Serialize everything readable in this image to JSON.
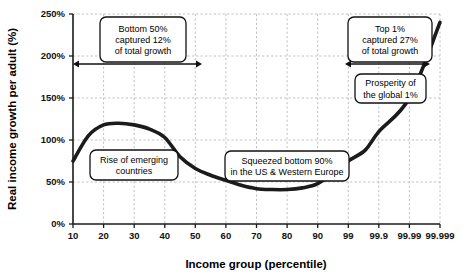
{
  "chart_data": {
    "type": "line",
    "title": "",
    "subtitle": "",
    "xlabel": "Income group (percentile)",
    "ylabel": "Real income growth per adult (%)",
    "grid": true,
    "legend": "none",
    "x_tick_labels": [
      "10",
      "20",
      "30",
      "40",
      "50",
      "60",
      "70",
      "80",
      "90",
      "99",
      "99.9",
      "99.99",
      "99.999"
    ],
    "y_tick_labels": [
      "0%",
      "50%",
      "100%",
      "150%",
      "200%",
      "250%"
    ],
    "y_tick_values": [
      0,
      50,
      100,
      150,
      200,
      250
    ],
    "ylim": [
      0,
      250
    ],
    "series": [
      {
        "name": "Real income growth per adult",
        "x": [
          "10",
          "15",
          "20",
          "25",
          "30",
          "35",
          "40",
          "45",
          "50",
          "55",
          "60",
          "65",
          "70",
          "75",
          "80",
          "85",
          "90",
          "95",
          "99",
          "99.5",
          "99.9",
          "99.99",
          "99.999"
        ],
        "values": [
          75,
          105,
          118,
          120,
          118,
          113,
          103,
          80,
          66,
          58,
          52,
          46,
          42,
          41,
          41,
          43,
          48,
          62,
          75,
          88,
          110,
          150,
          240
        ]
      }
    ],
    "annotations": [
      {
        "id": "bottom-50-callout",
        "lines": [
          "Bottom 50%",
          "captured 12%",
          "of total growth"
        ],
        "box_x": 100,
        "box_y": 17,
        "box_w": 86,
        "box_h": 45
      },
      {
        "id": "top-1-callout",
        "lines": [
          "Top 1%",
          "captured 27%",
          "of total growth"
        ],
        "box_x": 348,
        "box_y": 17,
        "box_w": 84,
        "box_h": 45
      },
      {
        "id": "rise-of-emerging-countries-callout",
        "lines": [
          "Rise of emerging",
          "countries"
        ],
        "box_x": 90,
        "box_y": 150,
        "box_w": 88,
        "box_h": 30
      },
      {
        "id": "squeezed-bottom-90-callout",
        "lines": [
          "Squeezed bottom 90%",
          "in the US & Western Europe"
        ],
        "box_x": 225,
        "box_y": 151,
        "box_w": 124,
        "box_h": 30
      },
      {
        "id": "prosperity-of-global-1-callout",
        "lines": [
          "Prosperity of",
          "the global 1%"
        ],
        "box_x": 355,
        "box_y": 74,
        "box_w": 71,
        "box_h": 29
      }
    ],
    "span_arrows": [
      {
        "id": "bottom-50-span",
        "x1": 73,
        "x2": 202,
        "y": 64
      },
      {
        "id": "top-1-span",
        "x1": 345,
        "x2": 430,
        "y": 64
      }
    ],
    "colors": {
      "curve": "#1b1b1b",
      "axis": "#1a1a1a",
      "grid": "#b9b9b9",
      "background": "#ffffff",
      "annotation_fill": "#ffffff",
      "annotation_stroke": "#111111"
    }
  }
}
